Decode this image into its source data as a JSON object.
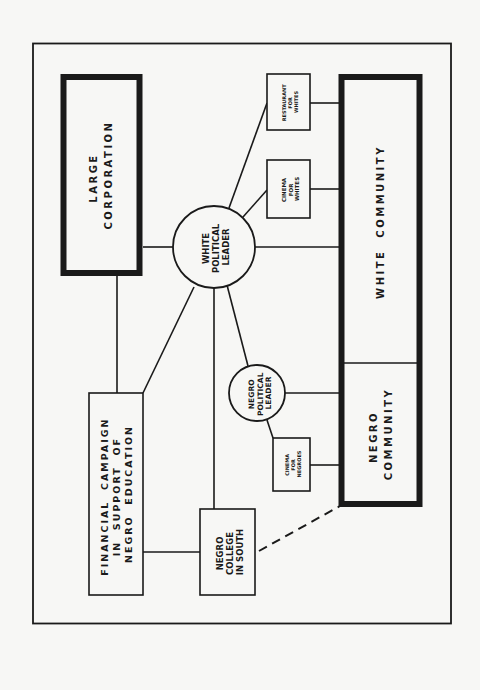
{
  "diagram": {
    "colors": {
      "ink": "#1a1a1a",
      "paper": "#f7f7f5"
    },
    "nodes": {
      "large_corporation": {
        "lines": [
          "LARGE",
          "CORPORATION"
        ]
      },
      "white_community": {
        "lines": [
          "WHITE  COMMUNITY"
        ]
      },
      "negro_community": {
        "lines": [
          "NEGRO",
          "COMMUNITY"
        ]
      },
      "white_political_leader": {
        "lines": [
          "WHITE",
          "POLITICAL",
          "LEADER"
        ]
      },
      "negro_political_leader": {
        "lines": [
          "NEGRO",
          "POLITICAL",
          "LEADER"
        ]
      },
      "restaurant_for_whites": {
        "lines": [
          "RESTAURANT",
          "FOR",
          "WHITES"
        ]
      },
      "cinema_for_whites": {
        "lines": [
          "CINEMA",
          "FOR",
          "WHITES"
        ]
      },
      "cinema_for_negroes": {
        "lines": [
          "CINEMA",
          "FOR",
          "NEGROES"
        ]
      },
      "financial_campaign": {
        "lines": [
          "FINANCIAL  CAMPAIGN",
          "IN  SUPPORT  OF",
          "NEGRO  EDUCATION"
        ]
      },
      "negro_college": {
        "lines": [
          "NEGRO",
          "COLLEGE",
          "IN SOUTH"
        ]
      }
    },
    "edges": [
      {
        "from": "large_corporation",
        "to": "white_political_leader",
        "style": "solid"
      },
      {
        "from": "large_corporation",
        "to": "financial_campaign",
        "style": "solid"
      },
      {
        "from": "white_political_leader",
        "to": "white_community",
        "style": "solid"
      },
      {
        "from": "white_political_leader",
        "to": "restaurant_for_whites",
        "style": "solid"
      },
      {
        "from": "white_political_leader",
        "to": "cinema_for_whites",
        "style": "solid"
      },
      {
        "from": "white_political_leader",
        "to": "financial_campaign",
        "style": "solid"
      },
      {
        "from": "white_political_leader",
        "to": "negro_college",
        "style": "solid"
      },
      {
        "from": "white_political_leader",
        "to": "negro_political_leader",
        "style": "solid"
      },
      {
        "from": "restaurant_for_whites",
        "to": "white_community",
        "style": "solid"
      },
      {
        "from": "cinema_for_whites",
        "to": "white_community",
        "style": "solid"
      },
      {
        "from": "negro_political_leader",
        "to": "negro_community",
        "style": "solid"
      },
      {
        "from": "negro_political_leader",
        "to": "cinema_for_negroes",
        "style": "solid"
      },
      {
        "from": "cinema_for_negroes",
        "to": "negro_community",
        "style": "solid"
      },
      {
        "from": "financial_campaign",
        "to": "negro_college",
        "style": "solid"
      },
      {
        "from": "negro_college",
        "to": "negro_community",
        "style": "dashed"
      }
    ]
  }
}
